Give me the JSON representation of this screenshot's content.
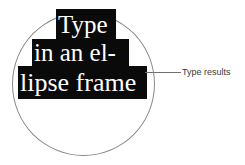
{
  "figure": {
    "shape": {
      "name": "ellipse-frame",
      "type": "circle-outline",
      "stroke_color": "#8a8a8a"
    },
    "text_blocks": {
      "background_color": "#0a0a0a",
      "text_color": "#ffffff",
      "lines": [
        {
          "text": "Type"
        },
        {
          "text": "in an el-"
        },
        {
          "text": "lipse frame"
        }
      ],
      "full_text": "Type in an ellipse frame"
    },
    "callout": {
      "label": "Type results",
      "leader_color": "#6f6f6f",
      "text_color": "#3a3a3a"
    }
  }
}
